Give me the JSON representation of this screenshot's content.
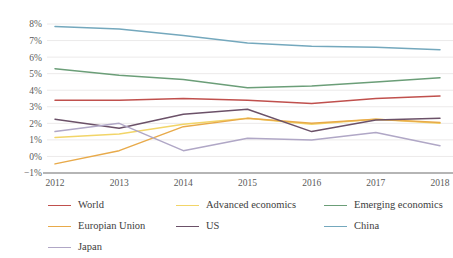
{
  "chart_data": {
    "type": "line",
    "title": "",
    "subtitle": "",
    "xlabel": "",
    "ylabel": "",
    "categories": [
      "2012",
      "2013",
      "2014",
      "2015",
      "2016",
      "2017",
      "2018"
    ],
    "x_tick_labels": [
      "2012",
      "2013",
      "2014",
      "2015",
      "2016",
      "2017",
      "2018"
    ],
    "y_tick_labels": [
      "8%",
      "7%",
      "6%",
      "5%",
      "4%",
      "3%",
      "2%",
      "1%",
      "0%",
      "−1%"
    ],
    "y_tick_values": [
      8,
      7,
      6,
      5,
      4,
      3,
      2,
      1,
      0,
      -1
    ],
    "ylim": [
      -1,
      8
    ],
    "grid": true,
    "grid_axis": "y",
    "legend_position": "bottom",
    "series": [
      {
        "name": "World",
        "color": "#c0504d",
        "values": [
          3.4,
          3.4,
          3.5,
          3.4,
          3.2,
          3.5,
          3.65
        ]
      },
      {
        "name": "Advanced economics",
        "color": "#f2d568",
        "values": [
          1.15,
          1.35,
          1.95,
          2.3,
          1.95,
          2.25,
          2.0
        ]
      },
      {
        "name": "Emerging economics",
        "color": "#6b9e78",
        "values": [
          5.3,
          4.9,
          4.65,
          4.15,
          4.25,
          4.5,
          4.75
        ]
      },
      {
        "name": "Europian Union",
        "color": "#e8aa4a",
        "values": [
          -0.45,
          0.35,
          1.8,
          2.3,
          2.0,
          2.25,
          2.05
        ]
      },
      {
        "name": "US",
        "color": "#6b5168",
        "values": [
          2.25,
          1.7,
          2.55,
          2.85,
          1.5,
          2.2,
          2.3
        ]
      },
      {
        "name": "China",
        "color": "#74a8bd",
        "values": [
          7.85,
          7.7,
          7.3,
          6.85,
          6.65,
          6.6,
          6.45
        ]
      },
      {
        "name": "Japan",
        "color": "#b0a7c6",
        "values": [
          1.5,
          2.0,
          0.35,
          1.1,
          1.0,
          1.45,
          0.65
        ]
      }
    ]
  },
  "legend": {
    "rows": [
      [
        {
          "name": "World",
          "color": "#c0504d"
        },
        {
          "name": "Advanced economics",
          "color": "#f2d568"
        },
        {
          "name": "Emerging economics",
          "color": "#6b9e78"
        }
      ],
      [
        {
          "name": "Europian Union",
          "color": "#e8aa4a"
        },
        {
          "name": "US",
          "color": "#6b5168"
        },
        {
          "name": "China",
          "color": "#74a8bd"
        }
      ],
      [
        {
          "name": "Japan",
          "color": "#b0a7c6"
        }
      ]
    ]
  },
  "style": {
    "background": "#ffffff",
    "gridline_color": "#eceaea",
    "axis_color": "#9d9d9d",
    "tick_text_color": "#5a5a5a"
  }
}
